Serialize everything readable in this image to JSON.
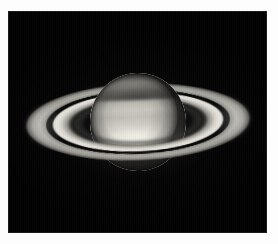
{
  "image": {
    "subject": "Saturn",
    "caption": "Telescopic image of the planet Saturn with its ring system",
    "type": "astronomical photograph",
    "background_color": "#020202",
    "frame_color": "#fdfdfd",
    "frame": {
      "left": 8,
      "top": 11,
      "right": 11,
      "bottom": 11
    },
    "canvas": {
      "width": 278,
      "height": 244
    }
  },
  "scene": {
    "tilt_degrees": -2.2,
    "planet": {
      "name": "Saturn",
      "label": "planet-globe",
      "width_px": 96,
      "height_px": 98,
      "center_x_px": 138,
      "center_y_px": 122,
      "highlight_color": "#f6f3ea",
      "midtone_color": "#c6c4bc",
      "shadow_color": "#4e4c48",
      "features": [
        "equatorial-zone-bright-band",
        "north-temperate-belt",
        "south-polar-darkening",
        "limb-darkening",
        "ring-shadow-on-northern-hemisphere"
      ]
    },
    "rings": {
      "label": "ring-system",
      "major_axis_px": 226,
      "minor_axis_px": 78,
      "components": [
        {
          "name": "A Ring",
          "description": "outer ring, moderate brightness",
          "color": "#b0aea7"
        },
        {
          "name": "Cassini Division",
          "description": "dark gap between A and B rings",
          "color": "#080808"
        },
        {
          "name": "B Ring",
          "description": "brightest and broadest ring",
          "color": "#e7e5dd"
        },
        {
          "name": "C Ring",
          "description": "faint inner crepe ring",
          "color": "#40403d"
        }
      ],
      "shadow_of_globe_on_rings": true
    }
  }
}
